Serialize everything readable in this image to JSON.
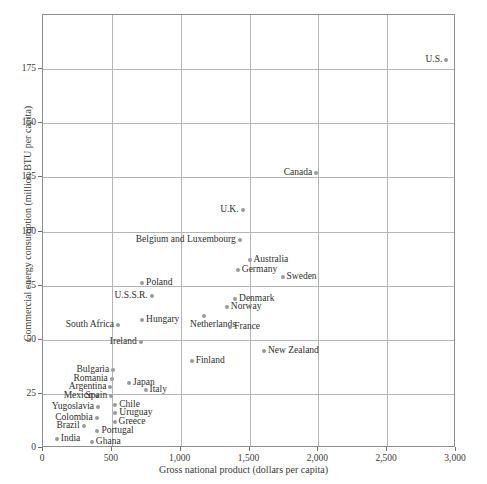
{
  "chart_data": {
    "type": "scatter",
    "title": "",
    "xlabel": "Gross national product (dollars per capita)",
    "ylabel": "Commercial energy consumption (million BTU per capita)",
    "xlim": [
      0,
      3000
    ],
    "ylim": [
      0,
      200
    ],
    "xticks": [
      0,
      500,
      1000,
      1500,
      2000,
      2500,
      3000
    ],
    "xticklabels": [
      "0",
      "500",
      "1,000",
      "1,500",
      "2,000",
      "2,500",
      "3,000"
    ],
    "yticks": [
      0,
      25,
      50,
      75,
      100,
      125,
      150,
      175
    ],
    "yticklabels": [
      "0",
      "25",
      "50",
      "75",
      "100",
      "125",
      "150",
      "175"
    ],
    "grid": true,
    "legend": null,
    "marker_color": "#9a9a9a",
    "grid_color": "#b5b5b5",
    "frame_color": "#8d8d8d",
    "points": [
      {
        "label": "U.S.",
        "x": 2930,
        "y": 179,
        "side": "left"
      },
      {
        "label": "Canada",
        "x": 1985,
        "y": 127,
        "side": "left"
      },
      {
        "label": "U.K.",
        "x": 1450,
        "y": 110,
        "side": "left"
      },
      {
        "label": "Belgium and Luxembourg",
        "x": 1430,
        "y": 96,
        "side": "left"
      },
      {
        "label": "Australia",
        "x": 1500,
        "y": 87,
        "side": "right"
      },
      {
        "label": "Germany",
        "x": 1415,
        "y": 82,
        "side": "right"
      },
      {
        "label": "Sweden",
        "x": 1740,
        "y": 79,
        "side": "right"
      },
      {
        "label": "Poland",
        "x": 720,
        "y": 76,
        "side": "right"
      },
      {
        "label": "U.S.S.R.",
        "x": 790,
        "y": 70,
        "side": "left"
      },
      {
        "label": "Denmark",
        "x": 1395,
        "y": 69,
        "side": "right"
      },
      {
        "label": "Norway",
        "x": 1335,
        "y": 65,
        "side": "right"
      },
      {
        "label": "Netherlands",
        "x": 1170,
        "y": 61,
        "side": "below"
      },
      {
        "label": "Hungary",
        "x": 720,
        "y": 59,
        "side": "right"
      },
      {
        "label": "South Africa",
        "x": 545,
        "y": 57,
        "side": "left"
      },
      {
        "label": "France",
        "x": 1360,
        "y": 56,
        "side": "right"
      },
      {
        "label": "Ireland",
        "x": 710,
        "y": 49,
        "side": "left"
      },
      {
        "label": "New Zealand",
        "x": 1605,
        "y": 45,
        "side": "right"
      },
      {
        "label": "Finland",
        "x": 1080,
        "y": 40,
        "side": "right"
      },
      {
        "label": "Bulgaria",
        "x": 510,
        "y": 36,
        "side": "left"
      },
      {
        "label": "Romania",
        "x": 500,
        "y": 32,
        "side": "left"
      },
      {
        "label": "Japan",
        "x": 625,
        "y": 30,
        "side": "right"
      },
      {
        "label": "Argentina",
        "x": 490,
        "y": 28,
        "side": "left"
      },
      {
        "label": "Italy",
        "x": 745,
        "y": 27,
        "side": "right"
      },
      {
        "label": "Mexico",
        "x": 390,
        "y": 24,
        "side": "left"
      },
      {
        "label": "Spain",
        "x": 495,
        "y": 24,
        "side": "left"
      },
      {
        "label": "Chile",
        "x": 525,
        "y": 20,
        "side": "right"
      },
      {
        "label": "Yugoslavia",
        "x": 400,
        "y": 19,
        "side": "left"
      },
      {
        "label": "Uruguay",
        "x": 525,
        "y": 16,
        "side": "right"
      },
      {
        "label": "Colombia",
        "x": 390,
        "y": 14,
        "side": "left"
      },
      {
        "label": "Greece",
        "x": 520,
        "y": 12,
        "side": "right"
      },
      {
        "label": "Brazil",
        "x": 295,
        "y": 10,
        "side": "left"
      },
      {
        "label": "Portugal",
        "x": 395,
        "y": 8,
        "side": "right"
      },
      {
        "label": "India",
        "x": 100,
        "y": 4,
        "side": "right"
      },
      {
        "label": "Ghana",
        "x": 355,
        "y": 3,
        "side": "right"
      }
    ]
  }
}
